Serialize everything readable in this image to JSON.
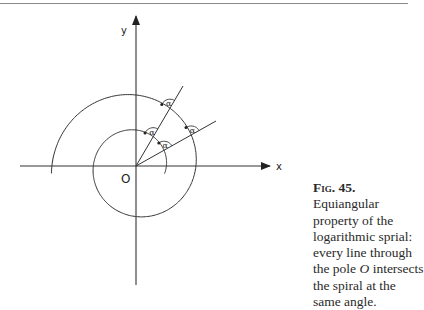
{
  "figure": {
    "axes": {
      "x_label": "x",
      "y_label": "y",
      "origin_label": "O",
      "origin": [
        136,
        166
      ]
    },
    "angle_label": "α",
    "rays": [
      {
        "name": "ray-1",
        "end": [
          183,
          86
        ]
      },
      {
        "name": "ray-2",
        "end": [
          216,
          121
        ]
      }
    ],
    "spiral": {
      "a": 30.4,
      "b": 0.108,
      "theta_start_deg": -15,
      "theta_end_deg": 545
    },
    "colors": {
      "line": "#333333",
      "rule": "#8a8a8a"
    }
  },
  "caption": {
    "title": "Fig. 45.",
    "line1": "Equiangular property of the logarithmic sprial: every line through the pole ",
    "pole": "O",
    "line2": " intersects the spiral at the same angle."
  }
}
